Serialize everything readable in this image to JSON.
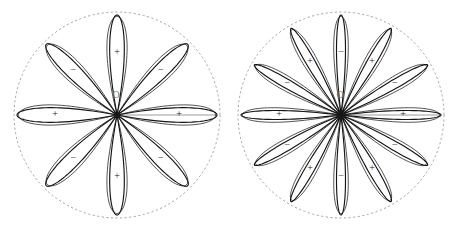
{
  "figure": {
    "caption": "",
    "background_color": "#ffffff",
    "stroke_color": "#151515",
    "dashed_circle_color": "#8e8e8e",
    "axis_color": "#9a9a9a",
    "origin_label": "O",
    "sign_positive": "+",
    "sign_negative": "−"
  },
  "chart_data": [
    {
      "type": "line",
      "name": "eight-petal-rose",
      "title": "",
      "polar": true,
      "equation_form": "r = cos(4θ)",
      "petal_count": 8,
      "angle_step_deg": 45,
      "center": {
        "x": 117,
        "y": 115
      },
      "boundary_radius": 103,
      "petal_length": 100,
      "petal_half_width_deg": 11.25,
      "origin_label": "O",
      "petals": [
        {
          "index": 0,
          "angle_deg": 0,
          "sign": "+",
          "label_radius": 62
        },
        {
          "index": 1,
          "angle_deg": 45,
          "sign": "−",
          "label_radius": 62
        },
        {
          "index": 2,
          "angle_deg": 90,
          "sign": "+",
          "label_radius": 62
        },
        {
          "index": 3,
          "angle_deg": 135,
          "sign": "−",
          "label_radius": 62
        },
        {
          "index": 4,
          "angle_deg": 180,
          "sign": "+",
          "label_radius": 62
        },
        {
          "index": 5,
          "angle_deg": 225,
          "sign": "−",
          "label_radius": 62
        },
        {
          "index": 6,
          "angle_deg": 270,
          "sign": "+",
          "label_radius": 62
        },
        {
          "index": 7,
          "angle_deg": 315,
          "sign": "−",
          "label_radius": 62
        }
      ],
      "axis_segments": [
        {
          "from_deg": 0,
          "to_radius": 100
        }
      ]
    },
    {
      "type": "line",
      "name": "twelve-petal-rose",
      "title": "",
      "polar": true,
      "equation_form": "r = cos(6θ)",
      "petal_count": 12,
      "angle_step_deg": 30,
      "center": {
        "x": 112,
        "y": 115
      },
      "boundary_radius": 103,
      "petal_length": 100,
      "petal_half_width_deg": 7.5,
      "origin_label": "O",
      "petals": [
        {
          "index": 0,
          "angle_deg": 0,
          "sign": "+",
          "label_radius": 62
        },
        {
          "index": 1,
          "angle_deg": 30,
          "sign": "−",
          "label_radius": 62
        },
        {
          "index": 2,
          "angle_deg": 60,
          "sign": "+",
          "label_radius": 62
        },
        {
          "index": 3,
          "angle_deg": 90,
          "sign": "−",
          "label_radius": 62
        },
        {
          "index": 4,
          "angle_deg": 120,
          "sign": "+",
          "label_radius": 62
        },
        {
          "index": 5,
          "angle_deg": 150,
          "sign": "−",
          "label_radius": 62
        },
        {
          "index": 6,
          "angle_deg": 180,
          "sign": "+",
          "label_radius": 62
        },
        {
          "index": 7,
          "angle_deg": 210,
          "sign": "−",
          "label_radius": 62
        },
        {
          "index": 8,
          "angle_deg": 240,
          "sign": "+",
          "label_radius": 62
        },
        {
          "index": 9,
          "angle_deg": 270,
          "sign": "−",
          "label_radius": 62
        },
        {
          "index": 10,
          "angle_deg": 300,
          "sign": "+",
          "label_radius": 62
        },
        {
          "index": 11,
          "angle_deg": 330,
          "sign": "−",
          "label_radius": 62
        }
      ],
      "axis_segments": [
        {
          "from_deg": 0,
          "to_radius": 100
        }
      ]
    }
  ]
}
